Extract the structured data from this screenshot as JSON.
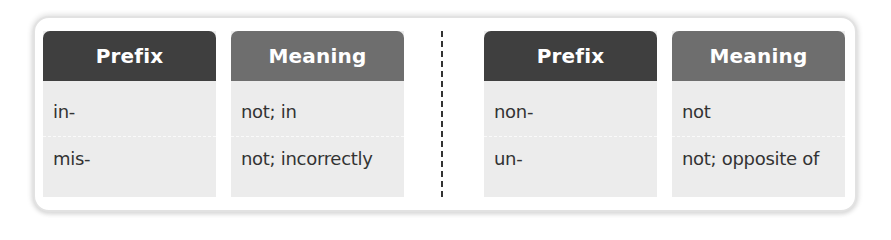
{
  "colors": {
    "prefix_header": "#3f3f3f",
    "meaning_header": "#6e6e6e",
    "cell_background": "#ececec",
    "card_background": "#ffffff",
    "text": "#333333",
    "divider": "#333333"
  },
  "tables": [
    {
      "headers": {
        "prefix": "Prefix",
        "meaning": "Meaning"
      },
      "rows": [
        {
          "prefix": "in-",
          "meaning": "not; in"
        },
        {
          "prefix": "mis-",
          "meaning": "not; incorrectly"
        }
      ]
    },
    {
      "headers": {
        "prefix": "Prefix",
        "meaning": "Meaning"
      },
      "rows": [
        {
          "prefix": "non-",
          "meaning": "not"
        },
        {
          "prefix": "un-",
          "meaning": "not; opposite of"
        }
      ]
    }
  ]
}
